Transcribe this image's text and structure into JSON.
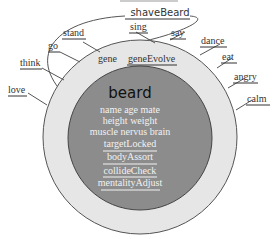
{
  "diagram": {
    "center_title": "beard",
    "top_label": "shaveBeard",
    "ring_labels": [
      "gene",
      "geneEvolve"
    ],
    "inner_lines": [
      "name age mate",
      "height weight",
      "muscle nervus brain",
      "targetLocked",
      "bodyAssort",
      "collideCheck",
      "mentalityAdjust"
    ],
    "outer_labels": {
      "stand": "stand",
      "go": "go",
      "think": "think",
      "love": "love",
      "sing": "sing",
      "say": "say",
      "dance": "dance",
      "eat": "eat",
      "angry": "angry",
      "calm": "calm"
    },
    "colors": {
      "outer_ring": "#e6e6e6",
      "inner_circle": "#8c8c8c",
      "stroke": "#555555"
    }
  }
}
